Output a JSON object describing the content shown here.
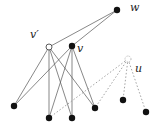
{
  "diagram": {
    "nodes": [
      {
        "id": "w",
        "label": "w",
        "x": 117,
        "y": 10,
        "style": "filled",
        "label_x": 130,
        "label_y": 11
      },
      {
        "id": "vp",
        "label": "v′",
        "x": 49,
        "y": 47,
        "style": "hollow",
        "label_x": 30,
        "label_y": 38
      },
      {
        "id": "v",
        "label": "v",
        "x": 72,
        "y": 46,
        "style": "filled",
        "label_x": 77,
        "label_y": 52
      },
      {
        "id": "u",
        "label": "u",
        "x": 128,
        "y": 59,
        "style": "hollow-dashed",
        "label_x": 135,
        "label_y": 72
      },
      {
        "id": "b1",
        "label": "",
        "x": 14,
        "y": 106,
        "style": "filled"
      },
      {
        "id": "b2",
        "label": "",
        "x": 49,
        "y": 118,
        "style": "filled"
      },
      {
        "id": "b3",
        "label": "",
        "x": 72,
        "y": 118,
        "style": "filled"
      },
      {
        "id": "b4",
        "label": "",
        "x": 95,
        "y": 108,
        "style": "filled"
      },
      {
        "id": "b5",
        "label": "",
        "x": 123,
        "y": 100,
        "style": "filled"
      },
      {
        "id": "b6",
        "label": "",
        "x": 146,
        "y": 112,
        "style": "filled"
      }
    ],
    "edges": [
      {
        "from": "vp",
        "to": "w",
        "style": "solid"
      },
      {
        "from": "v",
        "to": "w",
        "style": "solid"
      },
      {
        "from": "vp",
        "to": "b1",
        "style": "solid"
      },
      {
        "from": "vp",
        "to": "b2",
        "style": "solid"
      },
      {
        "from": "vp",
        "to": "b3",
        "style": "solid"
      },
      {
        "from": "vp",
        "to": "b4",
        "style": "solid"
      },
      {
        "from": "v",
        "to": "b1",
        "style": "solid"
      },
      {
        "from": "v",
        "to": "b2",
        "style": "solid"
      },
      {
        "from": "v",
        "to": "b3",
        "style": "solid"
      },
      {
        "from": "v",
        "to": "b4",
        "style": "solid"
      },
      {
        "from": "u",
        "to": "b2",
        "style": "dashed"
      },
      {
        "from": "u",
        "to": "b4",
        "style": "dashed"
      },
      {
        "from": "u",
        "to": "b5",
        "style": "dashed"
      },
      {
        "from": "u",
        "to": "b6",
        "style": "dashed"
      }
    ]
  }
}
